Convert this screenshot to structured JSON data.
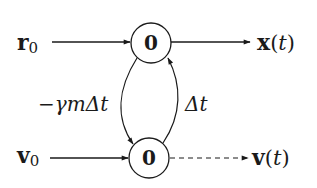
{
  "diagram": {
    "nodes": [
      {
        "id": "top",
        "label": "0",
        "cx": 151,
        "cy": 43,
        "r": 20
      },
      {
        "id": "bottom",
        "label": "0",
        "cx": 149,
        "cy": 158,
        "r": 20
      }
    ],
    "inputs": {
      "r0": {
        "main": "r",
        "sub": "0"
      },
      "v0": {
        "main": "v",
        "sub": "0"
      }
    },
    "outputs": {
      "x": {
        "main": "x",
        "open": "(",
        "var": "t",
        "close": ")",
        "line_style": "solid"
      },
      "v": {
        "main": "v",
        "open": "(",
        "var": "t",
        "close": ")",
        "line_style": "dashed"
      }
    },
    "edge_labels": {
      "top_to_bottom": {
        "minus": "−",
        "gamma": "γ",
        "m": "m",
        "delta": "Δ",
        "t": "t"
      },
      "bottom_to_top": {
        "delta": "Δ",
        "t": "t"
      }
    },
    "colors": {
      "ink": "#1a1a1a",
      "background": "#ffffff"
    }
  }
}
